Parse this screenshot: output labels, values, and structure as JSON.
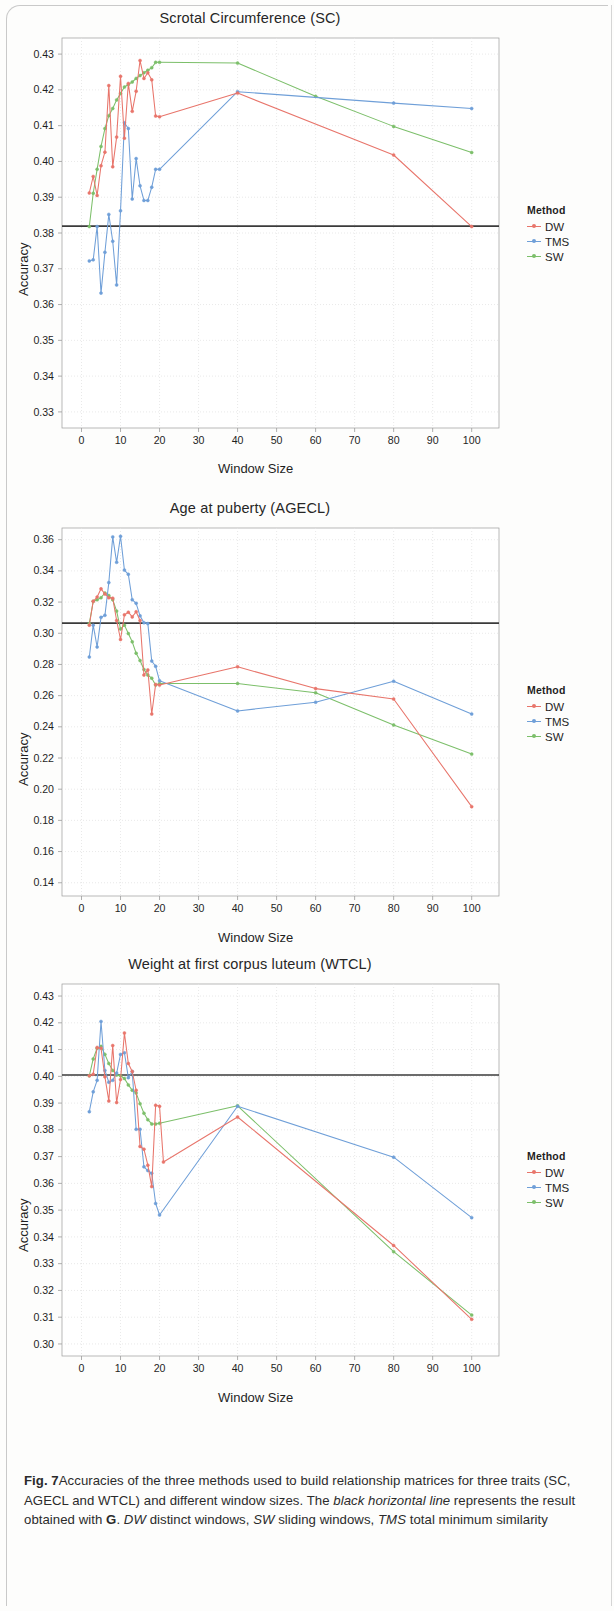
{
  "figure": {
    "label": "Fig. 7",
    "caption_part1": "Accuracies of the three methods used to build relationship matrices for three traits (SC, AGECL and WTCL) and different window sizes. The ",
    "caption_em1": "black horizontal line",
    "caption_part2": " represents the result obtained with ",
    "caption_bold_g": "G",
    "caption_part3": ". ",
    "caption_em2": "DW",
    "caption_part4": " distinct windows, ",
    "caption_em3": "SW",
    "caption_part5": " sliding windows, ",
    "caption_em4": "TMS",
    "caption_part6": " total minimum similarity"
  },
  "legend": {
    "title": "Method",
    "entries": [
      {
        "label": "DW",
        "color": "#e8756b"
      },
      {
        "label": "TMS",
        "color": "#6f9fd8"
      },
      {
        "label": "SW",
        "color": "#7cbf6a"
      }
    ]
  },
  "axes": {
    "xlabel": "Window  Size",
    "ylabel": "Accuracy"
  },
  "colors": {
    "DW": "#e8756b",
    "TMS": "#6f9fd8",
    "SW": "#7cbf6a",
    "reference_line": "#3b3b3b",
    "grid": "#e3e3e3",
    "axis": "#9a9a9a"
  },
  "chart_data": [
    {
      "type": "line",
      "title": "Scrotal Circumference (SC)",
      "xlabel": "Window  Size",
      "ylabel": "Accuracy",
      "xlim": [
        -5,
        107
      ],
      "ylim": [
        0.3255,
        0.4345
      ],
      "xticks": [
        0,
        10,
        20,
        30,
        40,
        50,
        60,
        70,
        80,
        90,
        100
      ],
      "yticks": [
        0.33,
        0.34,
        0.35,
        0.36,
        0.37,
        0.38,
        0.39,
        0.4,
        0.41,
        0.42,
        0.43
      ],
      "ytick_labels": [
        "0.33",
        "0.34",
        "0.35",
        "0.36",
        "0.37",
        "0.38",
        "0.39",
        "0.40",
        "0.41",
        "0.42",
        "0.43"
      ],
      "grid": true,
      "legend_position": "right",
      "reference_line": {
        "value": 0.3819,
        "label": "G",
        "color": "#3b3b3b"
      },
      "series": [
        {
          "name": "DW",
          "color": "#e8756b",
          "x": [
            2,
            3,
            4,
            5,
            6,
            7,
            8,
            9,
            10,
            11,
            12,
            13,
            14,
            15,
            16,
            17,
            18,
            19,
            20,
            40,
            80,
            100
          ],
          "y": [
            0.3912,
            0.3958,
            0.3905,
            0.3988,
            0.4026,
            0.4212,
            0.3985,
            0.4068,
            0.4238,
            0.4065,
            0.4218,
            0.414,
            0.4196,
            0.4282,
            0.4232,
            0.4248,
            0.4228,
            0.4127,
            0.4125,
            0.4191,
            0.4018,
            0.3818
          ]
        },
        {
          "name": "TMS",
          "color": "#6f9fd8",
          "x": [
            2,
            3,
            4,
            5,
            6,
            7,
            8,
            9,
            10,
            11,
            12,
            13,
            14,
            15,
            16,
            17,
            18,
            19,
            20,
            40,
            80,
            100
          ],
          "y": [
            0.3722,
            0.3725,
            0.3818,
            0.3632,
            0.3746,
            0.3852,
            0.3777,
            0.3655,
            0.3862,
            0.4108,
            0.4092,
            0.3895,
            0.4008,
            0.3932,
            0.3891,
            0.3891,
            0.3928,
            0.3978,
            0.3978,
            0.4195,
            0.4163,
            0.4148
          ]
        },
        {
          "name": "SW",
          "color": "#7cbf6a",
          "x": [
            2,
            3,
            4,
            5,
            6,
            7,
            8,
            9,
            10,
            11,
            12,
            13,
            14,
            15,
            16,
            17,
            18,
            19,
            20,
            40,
            60,
            80,
            100
          ],
          "y": [
            0.3818,
            0.3911,
            0.3978,
            0.4042,
            0.4092,
            0.4128,
            0.4148,
            0.4172,
            0.419,
            0.4208,
            0.4215,
            0.4222,
            0.4232,
            0.424,
            0.4248,
            0.4255,
            0.4262,
            0.4277,
            0.4277,
            0.4275,
            0.4182,
            0.4098,
            0.4025
          ]
        }
      ]
    },
    {
      "type": "line",
      "title": "Age at puberty (AGECL)",
      "xlabel": "Window  Size",
      "ylabel": "Accuracy",
      "xlim": [
        -5,
        107
      ],
      "ylim": [
        0.1315,
        0.3675
      ],
      "xticks": [
        0,
        10,
        20,
        30,
        40,
        50,
        60,
        70,
        80,
        90,
        100
      ],
      "yticks": [
        0.14,
        0.16,
        0.18,
        0.2,
        0.22,
        0.24,
        0.26,
        0.28,
        0.3,
        0.32,
        0.34,
        0.36
      ],
      "ytick_labels": [
        "0.14",
        "0.16",
        "0.18",
        "0.20",
        "0.22",
        "0.24",
        "0.26",
        "0.28",
        "0.30",
        "0.32",
        "0.34",
        "0.36"
      ],
      "grid": true,
      "legend_position": "right",
      "reference_line": {
        "value": 0.3065,
        "label": "G",
        "color": "#3b3b3b"
      },
      "series": [
        {
          "name": "DW",
          "color": "#e8756b",
          "x": [
            2,
            3,
            4,
            5,
            6,
            7,
            8,
            9,
            10,
            11,
            12,
            13,
            14,
            15,
            16,
            17,
            18,
            19,
            20,
            40,
            60,
            80,
            100
          ],
          "y": [
            0.3052,
            0.3205,
            0.3232,
            0.3285,
            0.3252,
            0.3228,
            0.3225,
            0.3082,
            0.296,
            0.3118,
            0.3135,
            0.3105,
            0.3138,
            0.3082,
            0.2732,
            0.2765,
            0.2482,
            0.2672,
            0.2668,
            0.2785,
            0.2645,
            0.2578,
            0.1888
          ]
        },
        {
          "name": "TMS",
          "color": "#6f9fd8",
          "x": [
            2,
            3,
            4,
            5,
            6,
            7,
            8,
            9,
            10,
            11,
            12,
            13,
            14,
            15,
            16,
            17,
            18,
            19,
            20,
            40,
            60,
            80,
            100
          ],
          "y": [
            0.2848,
            0.3052,
            0.2912,
            0.3102,
            0.3115,
            0.3325,
            0.3618,
            0.3455,
            0.3622,
            0.3405,
            0.3378,
            0.3215,
            0.3192,
            0.3112,
            0.3068,
            0.3062,
            0.2822,
            0.2788,
            0.2695,
            0.2502,
            0.2558,
            0.2692,
            0.2482
          ]
        },
        {
          "name": "SW",
          "color": "#7cbf6a",
          "x": [
            2,
            3,
            4,
            5,
            6,
            7,
            8,
            9,
            10,
            11,
            12,
            13,
            14,
            15,
            16,
            17,
            18,
            19,
            20,
            40,
            60,
            80,
            100
          ],
          "y": [
            0.3062,
            0.3205,
            0.3215,
            0.3228,
            0.3258,
            0.3242,
            0.3215,
            0.3142,
            0.3028,
            0.3052,
            0.2998,
            0.2945,
            0.2872,
            0.2825,
            0.2768,
            0.2732,
            0.2712,
            0.2668,
            0.2678,
            0.2678,
            0.2618,
            0.2412,
            0.2225
          ]
        }
      ]
    },
    {
      "type": "line",
      "title": "Weight at first corpus luteum  (WTCL)",
      "xlabel": "Window  Size",
      "ylabel": "Accuracy",
      "xlim": [
        -5,
        107
      ],
      "ylim": [
        0.2955,
        0.4345
      ],
      "xticks": [
        0,
        10,
        20,
        30,
        40,
        50,
        60,
        70,
        80,
        90,
        100
      ],
      "yticks": [
        0.3,
        0.31,
        0.32,
        0.33,
        0.34,
        0.35,
        0.36,
        0.37,
        0.38,
        0.39,
        0.4,
        0.41,
        0.42,
        0.43
      ],
      "ytick_labels": [
        "0.30",
        "0.31",
        "0.32",
        "0.33",
        "0.34",
        "0.35",
        "0.36",
        "0.37",
        "0.38",
        "0.39",
        "0.40",
        "0.41",
        "0.42",
        "0.43"
      ],
      "grid": true,
      "legend_position": "right",
      "reference_line": {
        "value": 0.4005,
        "label": "G",
        "color": "#3b3b3b"
      },
      "series": [
        {
          "name": "DW",
          "color": "#e8756b",
          "x": [
            2,
            3,
            4,
            5,
            6,
            7,
            8,
            9,
            10,
            11,
            12,
            13,
            14,
            15,
            16,
            17,
            18,
            19,
            20,
            21,
            40,
            80,
            100
          ],
          "y": [
            0.4002,
            0.4008,
            0.4108,
            0.4105,
            0.3998,
            0.3908,
            0.4115,
            0.3902,
            0.3988,
            0.4162,
            0.4048,
            0.4018,
            0.3948,
            0.3738,
            0.3728,
            0.3668,
            0.3588,
            0.3892,
            0.3888,
            0.368,
            0.3848,
            0.3368,
            0.3092
          ]
        },
        {
          "name": "TMS",
          "color": "#6f9fd8",
          "x": [
            2,
            3,
            4,
            5,
            6,
            7,
            8,
            9,
            10,
            11,
            12,
            13,
            14,
            15,
            16,
            17,
            18,
            19,
            20,
            40,
            80,
            100
          ],
          "y": [
            0.3868,
            0.3942,
            0.3985,
            0.4205,
            0.4022,
            0.3978,
            0.3985,
            0.4012,
            0.4082,
            0.4088,
            0.3995,
            0.4018,
            0.3802,
            0.3802,
            0.3662,
            0.3648,
            0.3638,
            0.3525,
            0.3482,
            0.3888,
            0.3698,
            0.3472
          ]
        },
        {
          "name": "SW",
          "color": "#7cbf6a",
          "x": [
            2,
            3,
            4,
            5,
            6,
            7,
            8,
            9,
            10,
            11,
            12,
            13,
            14,
            15,
            16,
            17,
            18,
            19,
            20,
            40,
            80,
            100
          ],
          "y": [
            0.4002,
            0.4065,
            0.4105,
            0.4112,
            0.4082,
            0.4048,
            0.4022,
            0.4005,
            0.4002,
            0.3992,
            0.3968,
            0.3948,
            0.3938,
            0.3898,
            0.3862,
            0.3838,
            0.3822,
            0.3822,
            0.3825,
            0.389,
            0.3345,
            0.3108
          ]
        }
      ]
    }
  ]
}
